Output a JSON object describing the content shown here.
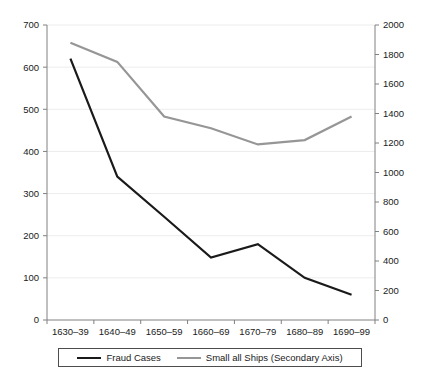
{
  "chart_data": {
    "type": "line",
    "title": "",
    "xlabel": "",
    "ylabel": "",
    "grid": true,
    "legend_position": "bottom",
    "categories": [
      "1630–39",
      "1640–49",
      "1650–59",
      "1660–69",
      "1670–79",
      "1680–89",
      "1690–99"
    ],
    "series": [
      {
        "name": "Fraud Cases",
        "axis": "primary",
        "color": "#1a1a1a",
        "values": [
          620,
          340,
          245,
          148,
          180,
          100,
          60
        ]
      },
      {
        "name": "Small all Ships (Secondary Axis)",
        "axis": "secondary",
        "color": "#969696",
        "values": [
          1880,
          1750,
          1380,
          1300,
          1190,
          1220,
          1380
        ]
      }
    ],
    "primary_axis": {
      "ylim": [
        0,
        700
      ],
      "tick_step": 100,
      "ticks": [
        0,
        100,
        200,
        300,
        400,
        500,
        600,
        700
      ],
      "tick_labels": [
        "0",
        "100",
        "200",
        "300",
        "400",
        "500",
        "600",
        "700"
      ]
    },
    "secondary_axis": {
      "ylim": [
        0,
        2000
      ],
      "tick_step": 200,
      "ticks": [
        0,
        200,
        400,
        600,
        800,
        1000,
        1200,
        1400,
        1600,
        1800,
        2000
      ],
      "tick_labels": [
        "0",
        "200",
        "400",
        "600",
        "800",
        "1000",
        "1200",
        "1400",
        "1600",
        "1800",
        "2000"
      ]
    }
  },
  "legend": {
    "entries": [
      {
        "label": "Fraud Cases",
        "color": "#1a1a1a"
      },
      {
        "label": "Small all Ships (Secondary Axis)",
        "color": "#969696"
      }
    ]
  },
  "caption": {
    "text": ""
  }
}
